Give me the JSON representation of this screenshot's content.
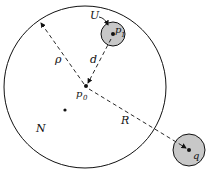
{
  "labels": {
    "U": "U",
    "p1": "p",
    "p1_sub": "1",
    "p0": "p",
    "p0_sub": "0",
    "rho": "ρ",
    "d": "d",
    "R": "R",
    "N": "N",
    "q": "q"
  },
  "colors": {
    "stroke": "#111111",
    "fill_shaded": "#c8c8c8",
    "background": "#ffffff"
  }
}
